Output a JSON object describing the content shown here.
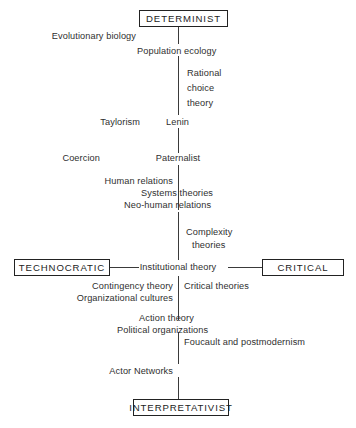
{
  "diagram": {
    "background": "#ffffff",
    "line_color": "#3a3a3a",
    "box_border_color": "#222222",
    "text_color": "#2f2f2f"
  },
  "boxes": {
    "determinist": "DETERMINIST",
    "technocratic": "TECHNOCRATIC",
    "critical": "CRITICAL",
    "interpretativist": "INTERPRETATIVIST"
  },
  "nodes": {
    "evolutionary_biology": "Evolutionary biology",
    "population_ecology": "Population ecology",
    "rational_choice_theory": "Rational\nchoice\ntheory",
    "rational_choice_line1": "Rational",
    "rational_choice_line2": "choice",
    "rational_choice_line3": "theory",
    "taylorism": "Taylorism",
    "lenin": "Lenin",
    "coercion": "Coercion",
    "paternalist": "Paternalist",
    "human_relations": "Human relations",
    "systems_theories": "Systems theories",
    "neo_human_relations": "Neo-human relations",
    "complexity_line1": "Complexity",
    "complexity_line2": "theories",
    "institutional_theory": "Institutional theory",
    "contingency_theory": "Contingency theory",
    "organizational_cultures": "Organizational cultures",
    "critical_theories": "Critical theories",
    "action_theory": "Action theory",
    "political_organizations": "Political organizations",
    "foucault_and_postmodernism": "Foucault and postmodernism",
    "actor_networks": "Actor Networks"
  }
}
